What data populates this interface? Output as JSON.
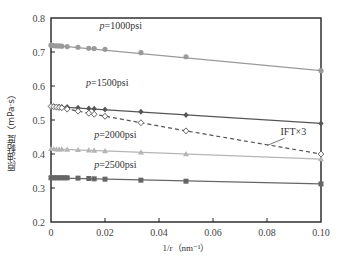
{
  "chart_data": {
    "type": "line",
    "title": "",
    "xlabel": "1/r（nm⁻¹）",
    "ylabel": "原油黏度（mPa·s）",
    "xlim": [
      0,
      0.1
    ],
    "ylim": [
      0.2,
      0.8
    ],
    "x_ticks": [
      "0",
      "0.02",
      "0.04",
      "0.06",
      "0.08",
      "0.10"
    ],
    "y_ticks": [
      "0.2",
      "0.3",
      "0.4",
      "0.5",
      "0.6",
      "0.7",
      "0.8"
    ],
    "grid": false,
    "legend": "inline labels",
    "series": [
      {
        "name": "p=1000psi",
        "label": "p=1000psi",
        "marker": "circle",
        "line": "solid",
        "color": "#9a9a9a",
        "x": [
          0,
          0.001,
          0.002,
          0.003,
          0.004,
          0.006,
          0.01,
          0.014,
          0.016,
          0.02,
          0.0333,
          0.05,
          0.1
        ],
        "y": [
          0.72,
          0.719,
          0.718,
          0.718,
          0.717,
          0.716,
          0.714,
          0.711,
          0.71,
          0.708,
          0.698,
          0.686,
          0.645
        ]
      },
      {
        "name": "p=1500psi",
        "label": "p=1500psi",
        "marker": "diamond-filled",
        "line": "solid",
        "color": "#555555",
        "x": [
          0,
          0.001,
          0.002,
          0.003,
          0.004,
          0.006,
          0.01,
          0.014,
          0.016,
          0.02,
          0.0333,
          0.05,
          0.1
        ],
        "y": [
          0.54,
          0.54,
          0.539,
          0.539,
          0.538,
          0.538,
          0.536,
          0.534,
          0.533,
          0.531,
          0.524,
          0.515,
          0.49
        ]
      },
      {
        "name": "IFT×3",
        "label": "IFT×3",
        "marker": "diamond-open",
        "line": "dashed",
        "color": "#555555",
        "x": [
          0,
          0.001,
          0.002,
          0.003,
          0.004,
          0.006,
          0.01,
          0.014,
          0.016,
          0.02,
          0.0333,
          0.05,
          0.1
        ],
        "y": [
          0.54,
          0.539,
          0.538,
          0.537,
          0.536,
          0.532,
          0.526,
          0.52,
          0.517,
          0.511,
          0.492,
          0.468,
          0.4
        ]
      },
      {
        "name": "p=2000psi",
        "label": "p=2000psi",
        "marker": "triangle",
        "line": "solid",
        "color": "#b5b5b5",
        "x": [
          0,
          0.001,
          0.002,
          0.003,
          0.004,
          0.006,
          0.01,
          0.014,
          0.016,
          0.02,
          0.0333,
          0.05,
          0.1
        ],
        "y": [
          0.415,
          0.415,
          0.414,
          0.414,
          0.414,
          0.413,
          0.412,
          0.411,
          0.41,
          0.409,
          0.405,
          0.4,
          0.385
        ]
      },
      {
        "name": "p=2500psi",
        "label": "p=2500psi",
        "marker": "square",
        "line": "solid",
        "color": "#666666",
        "x": [
          0,
          0.001,
          0.002,
          0.003,
          0.004,
          0.005,
          0.006,
          0.01,
          0.014,
          0.016,
          0.02,
          0.0333,
          0.05,
          0.1
        ],
        "y": [
          0.33,
          0.33,
          0.33,
          0.33,
          0.33,
          0.33,
          0.33,
          0.329,
          0.328,
          0.327,
          0.326,
          0.323,
          0.32,
          0.312
        ]
      }
    ],
    "annotations": [
      {
        "text": "p=1000psi",
        "x": 0.018,
        "y": 0.768
      },
      {
        "text": "p=1500psi",
        "x": 0.013,
        "y": 0.6
      },
      {
        "text": "p=2000psi",
        "x": 0.016,
        "y": 0.448
      },
      {
        "text": "p=2500psi",
        "x": 0.016,
        "y": 0.36
      },
      {
        "text": "IFT×3",
        "x": 0.085,
        "y": 0.455,
        "arrow_to": [
          0.08,
          0.425
        ]
      }
    ]
  }
}
